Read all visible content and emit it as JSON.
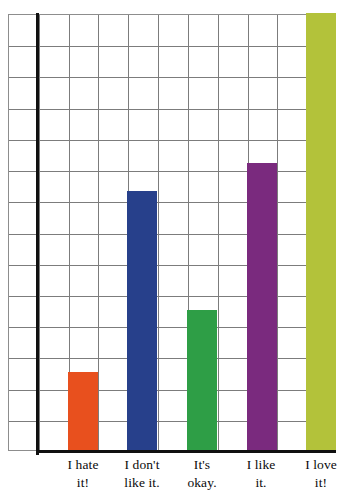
{
  "chart_data": {
    "type": "bar",
    "title": "",
    "subtitle": "",
    "xlabel": "",
    "ylabel": "",
    "categories": [
      "I hate it!",
      "I don't like it.",
      "It's okay.",
      "I like it.",
      "I love it!"
    ],
    "category_lines": [
      [
        "I hate",
        "it!"
      ],
      [
        "I don't",
        "like it."
      ],
      [
        "It's",
        "okay."
      ],
      [
        "I like",
        "it."
      ],
      [
        "I love",
        "it!"
      ]
    ],
    "values": [
      2.5,
      8.3,
      4.5,
      9.2,
      14
    ],
    "ylim": [
      0,
      14
    ],
    "y_gridlines": 14,
    "x_gridlines": 11,
    "grid": true,
    "legend": "none",
    "colors": [
      "#e8501e",
      "#27408b",
      "#2e9e46",
      "#7a2a7e",
      "#b3c23a"
    ],
    "grid_color": "#7c7c7c",
    "axis_color": "#101010",
    "background": "#ffffff",
    "tick_labels_y": [],
    "tick_labels_x": [
      "I hate it!",
      "I don't like it.",
      "It's okay.",
      "I like it.",
      "I love it!"
    ],
    "annotations": []
  }
}
